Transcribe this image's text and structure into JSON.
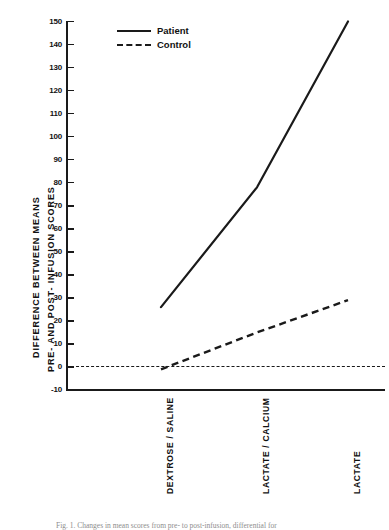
{
  "figure": {
    "caption": "Fig. 1. Changes in mean scores from pre- to post-infusion, differential for"
  },
  "legend": {
    "position": "top-left-inside",
    "entries": [
      {
        "label": "Patient",
        "style": "solid"
      },
      {
        "label": "Control",
        "style": "dashed"
      }
    ]
  },
  "axes": {
    "ylabel_line1": "DIFFERENCE  BETWEEN  MEANS",
    "ylabel_line2": "PRE-  AND  POST-  INFUSION  SCORES",
    "xlabel": "",
    "yticks": [
      150,
      140,
      130,
      120,
      110,
      100,
      90,
      80,
      70,
      60,
      50,
      40,
      30,
      20,
      10,
      0,
      -10
    ],
    "ytick_labels": [
      "150",
      "140",
      "130",
      "120",
      "110",
      "100",
      "90",
      "80",
      "70",
      "60",
      "50",
      "40",
      "30",
      "20",
      "10",
      "0",
      "-10"
    ],
    "ylim": [
      -10,
      150
    ],
    "zero_reference_line": true,
    "grid": false
  },
  "chart_data": {
    "type": "line",
    "title": "",
    "xlabel": "",
    "ylabel": "DIFFERENCE BETWEEN MEANS PRE- AND POST- INFUSION SCORES",
    "categories": [
      "DEXTROSE / SALINE",
      "LACTATE / CALCIUM",
      "LACTATE"
    ],
    "ylim": [
      -10,
      150
    ],
    "ytick_step": 10,
    "series": [
      {
        "name": "Patient",
        "style": "solid",
        "values": [
          26,
          78,
          150
        ]
      },
      {
        "name": "Control",
        "style": "dashed",
        "values": [
          -1,
          15,
          29
        ]
      }
    ],
    "annotations": [
      {
        "text": "zero reference line",
        "y": 0,
        "style": "dashed"
      }
    ],
    "legend_position": "upper left"
  }
}
